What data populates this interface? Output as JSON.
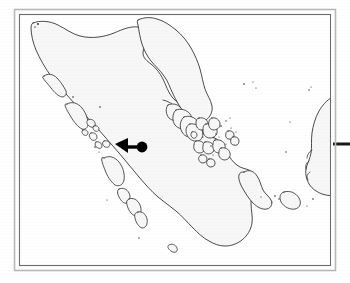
{
  "figure": {
    "type": "locator-map",
    "caption": "",
    "region_name": "Sumatra, Indonesia",
    "background_color": "#ffffff",
    "land_fill_color": "#f7f7f7",
    "coastline_color": "#2b2b2b",
    "marker_color": "#000000",
    "frame_outer_color": "#b9b9b9",
    "frame_inner_color": "#6f6f6f"
  },
  "frame": {
    "outer": {
      "x": 14,
      "y": 9,
      "width": 322,
      "height": 262,
      "label": "outer-frame"
    },
    "inner": {
      "x": 19,
      "y": 14,
      "width": 312,
      "height": 252,
      "label": "inner-frame"
    }
  },
  "marker": {
    "label": "study-site-marker",
    "kind": "filled-circle-with-leader-arrow",
    "circle": {
      "cx": 142,
      "cy": 147,
      "r": 5.4
    },
    "leader_bar": {
      "x1": 124,
      "y1": 147,
      "x2": 137,
      "y2": 147,
      "thickness": 3.4
    },
    "arrow_head": {
      "tip_x": 115,
      "tip_y": 144,
      "back_x": 128,
      "top_y": 138,
      "bottom_y": 153
    }
  },
  "scale_rule": {
    "label": "right-edge-rule",
    "x1": 333,
    "x2": 350,
    "y": 144,
    "thickness": 3
  },
  "map_features": [
    {
      "name": "sumatra-mainland",
      "type": "landmass"
    },
    {
      "name": "simeulue-island",
      "type": "island"
    },
    {
      "name": "nias-island",
      "type": "island"
    },
    {
      "name": "batu-islands",
      "type": "island-group"
    },
    {
      "name": "siberut-island",
      "type": "island"
    },
    {
      "name": "sipura-island",
      "type": "island"
    },
    {
      "name": "pagai-islands",
      "type": "island-group"
    },
    {
      "name": "enggano-island",
      "type": "island"
    },
    {
      "name": "riau-archipelago",
      "type": "island-group"
    },
    {
      "name": "singapore-johor-coast",
      "type": "landmass"
    },
    {
      "name": "bintan-island",
      "type": "island"
    },
    {
      "name": "bangka-island",
      "type": "island"
    },
    {
      "name": "belitung-island",
      "type": "island"
    },
    {
      "name": "borneo-west-coast",
      "type": "landmass"
    },
    {
      "name": "malay-peninsula",
      "type": "landmass"
    }
  ]
}
